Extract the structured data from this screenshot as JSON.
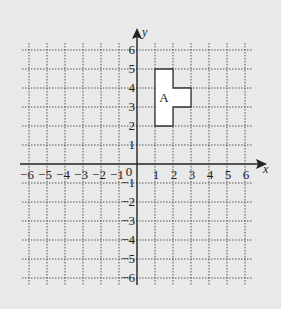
{
  "diagram": {
    "type": "coordinate-grid",
    "x_range": [
      -6,
      6
    ],
    "y_range": [
      -6,
      6
    ],
    "x_axis_label": "x",
    "y_axis_label": "y",
    "origin_label": "0",
    "x_ticks": [
      "-6",
      "-5",
      "-4",
      "-3",
      "-2",
      "-1",
      "1",
      "2",
      "3",
      "4",
      "5",
      "6"
    ],
    "y_ticks": [
      "6",
      "5",
      "4",
      "3",
      "2",
      "1",
      "-1",
      "-2",
      "-3",
      "-4",
      "-5",
      "-6"
    ],
    "shapes": [
      {
        "label": "A",
        "vertices": [
          [
            1,
            2
          ],
          [
            2,
            2
          ],
          [
            2,
            3
          ],
          [
            3,
            3
          ],
          [
            3,
            4
          ],
          [
            2,
            4
          ],
          [
            2,
            5
          ],
          [
            1,
            5
          ]
        ],
        "label_position": [
          1.5,
          3.5
        ],
        "fill": "#ffffff",
        "stroke": "#333333"
      }
    ],
    "colors": {
      "background": "#e9e9e9",
      "grid": "#555555",
      "axis": "#222222"
    }
  }
}
